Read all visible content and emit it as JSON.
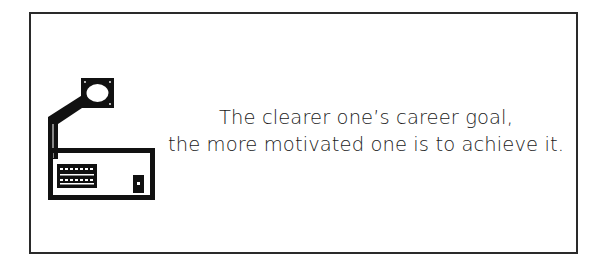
{
  "illustration": {
    "icon": "desk-lamp-workstation-icon",
    "color": "#111111"
  },
  "quote": {
    "lines": [
      "The clearer one’s career goal,",
      "the more motivated one is to achieve it."
    ]
  },
  "frame": {
    "border_color": "#2a2a2a",
    "background": "#ffffff"
  }
}
